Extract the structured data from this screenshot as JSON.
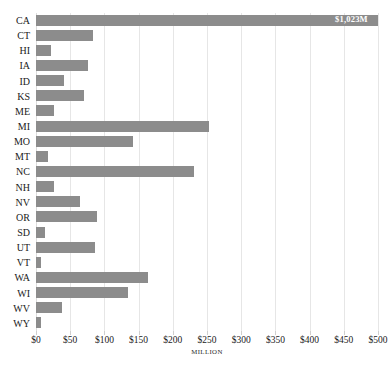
{
  "chart_data": {
    "type": "bar",
    "orientation": "horizontal",
    "title": "",
    "xlabel": "MILLION",
    "ylabel": "",
    "categories": [
      "CA",
      "CT",
      "HI",
      "IA",
      "ID",
      "KS",
      "ME",
      "MI",
      "MO",
      "MT",
      "NC",
      "NH",
      "NV",
      "OR",
      "SD",
      "UT",
      "VT",
      "WA",
      "WI",
      "WV",
      "WY"
    ],
    "values": [
      1023,
      83,
      22,
      76,
      41,
      70,
      26,
      253,
      142,
      18,
      231,
      26,
      64,
      89,
      13,
      86,
      7,
      164,
      135,
      38,
      7
    ],
    "value_labels": [
      "$1,023M",
      "",
      "",
      "",
      "",
      "",
      "",
      "",
      "",
      "",
      "",
      "",
      "",
      "",
      "",
      "",
      "",
      "",
      "",
      "",
      ""
    ],
    "xlim": [
      0,
      500
    ],
    "xticks": [
      0,
      50,
      100,
      150,
      200,
      250,
      300,
      350,
      400,
      450,
      500
    ],
    "xticklabels": [
      "$0",
      "$50",
      "$100",
      "$150",
      "$200",
      "$250",
      "$300",
      "$350",
      "$400",
      "$450",
      "$500"
    ],
    "unit_tick_index": 5,
    "grid": true,
    "legend": false,
    "bar_color": "#8c8c8c",
    "grid_color": "#e6e6e6",
    "label_text_color": "#ffffff"
  }
}
